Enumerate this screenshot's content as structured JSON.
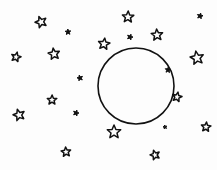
{
  "scene": {
    "description": "Hand-drawn sketch of a circle (moon) surrounded by stars",
    "ink_color": "#111111",
    "background": "#fdfdfd",
    "circle": {
      "cx": 136,
      "cy": 86,
      "r": 38
    },
    "stars": [
      {
        "x": 41,
        "y": 22,
        "size": 6
      },
      {
        "x": 68,
        "y": 32,
        "size": 3
      },
      {
        "x": 16,
        "y": 57,
        "size": 5
      },
      {
        "x": 54,
        "y": 54,
        "size": 6
      },
      {
        "x": 104,
        "y": 44,
        "size": 6
      },
      {
        "x": 80,
        "y": 78,
        "size": 3
      },
      {
        "x": 128,
        "y": 17,
        "size": 6
      },
      {
        "x": 130,
        "y": 37,
        "size": 3
      },
      {
        "x": 157,
        "y": 35,
        "size": 6
      },
      {
        "x": 200,
        "y": 16,
        "size": 3
      },
      {
        "x": 197,
        "y": 58,
        "size": 7
      },
      {
        "x": 168,
        "y": 70,
        "size": 3
      },
      {
        "x": 19,
        "y": 115,
        "size": 6
      },
      {
        "x": 52,
        "y": 100,
        "size": 5
      },
      {
        "x": 76,
        "y": 113,
        "size": 3
      },
      {
        "x": 66,
        "y": 152,
        "size": 5
      },
      {
        "x": 177,
        "y": 97,
        "size": 5
      },
      {
        "x": 165,
        "y": 127,
        "size": 2
      },
      {
        "x": 206,
        "y": 127,
        "size": 5
      },
      {
        "x": 155,
        "y": 155,
        "size": 5
      },
      {
        "x": 114,
        "y": 132,
        "size": 7
      }
    ]
  }
}
